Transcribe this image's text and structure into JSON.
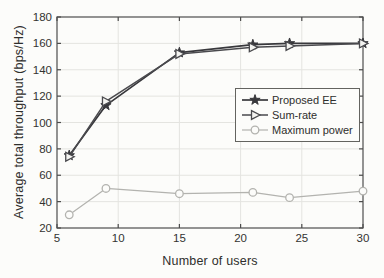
{
  "figure": {
    "background": "#fcfcfa"
  },
  "chart_data": {
    "type": "line",
    "title": "",
    "xlabel": "Number of users",
    "ylabel": "Average total throughput (bps/Hz)",
    "xlim": [
      5,
      30
    ],
    "ylim": [
      20,
      180
    ],
    "xticks": [
      5,
      10,
      15,
      20,
      25,
      30
    ],
    "yticks": [
      20,
      40,
      60,
      80,
      100,
      120,
      140,
      160,
      180
    ],
    "grid": true,
    "legend_position": "middle-right",
    "x": [
      6,
      9,
      15,
      21,
      24,
      30
    ],
    "series": [
      {
        "name": "Proposed EE",
        "marker": "star",
        "color": "#38383c",
        "marker_fill": "#38383c",
        "line_width": 1.7,
        "values": [
          75,
          113,
          153,
          159,
          160,
          160
        ]
      },
      {
        "name": "Sum-rate",
        "marker": "triangle-right",
        "color": "#4a4a4e",
        "marker_fill": "#f4f4f1",
        "line_width": 1.5,
        "values": [
          74,
          116,
          152,
          157,
          158,
          160
        ]
      },
      {
        "name": "Maximum power",
        "marker": "circle",
        "color": "#b3b3af",
        "marker_fill": "#fcfcfa",
        "line_width": 1.2,
        "values": [
          30,
          50,
          46,
          47,
          43,
          48
        ]
      }
    ],
    "colors": {
      "grid": "#e4e4e0",
      "axis": "#4d4d4d",
      "tick_label": "#333331",
      "axis_label": "#2e2e2c"
    }
  }
}
